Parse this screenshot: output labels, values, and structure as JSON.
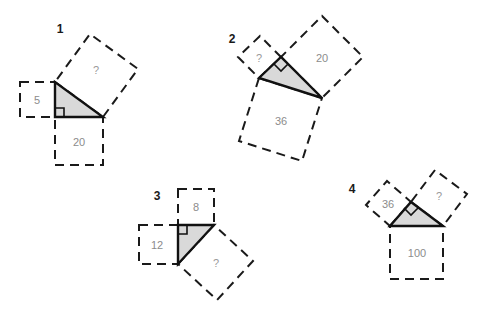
{
  "page": {
    "background_color": "#ffffff",
    "width": 485,
    "height": 329
  },
  "style": {
    "triangle_fill": "#d9d9d9",
    "triangle_stroke": "#111111",
    "square_stroke": "#1a1a1a",
    "square_fill": "#ffffff",
    "label_color": "#8c8c8c",
    "number_color": "#1a1a1a"
  },
  "figures": [
    {
      "number": "1",
      "squares": [
        {
          "name": "leg-vertical-square",
          "value": "5"
        },
        {
          "name": "leg-horizontal-square",
          "value": "20"
        },
        {
          "name": "hypotenuse-square",
          "value": "?"
        }
      ]
    },
    {
      "number": "2",
      "squares": [
        {
          "name": "leg-short-square",
          "value": "?"
        },
        {
          "name": "leg-long-square",
          "value": "20"
        },
        {
          "name": "hypotenuse-square",
          "value": "36"
        }
      ]
    },
    {
      "number": "3",
      "squares": [
        {
          "name": "leg-top-square",
          "value": "8"
        },
        {
          "name": "leg-left-square",
          "value": "12"
        },
        {
          "name": "hypotenuse-square",
          "value": "?"
        }
      ]
    },
    {
      "number": "4",
      "squares": [
        {
          "name": "leg-left-square",
          "value": "36"
        },
        {
          "name": "leg-right-square",
          "value": "?"
        },
        {
          "name": "hypotenuse-square",
          "value": "100"
        }
      ]
    }
  ]
}
